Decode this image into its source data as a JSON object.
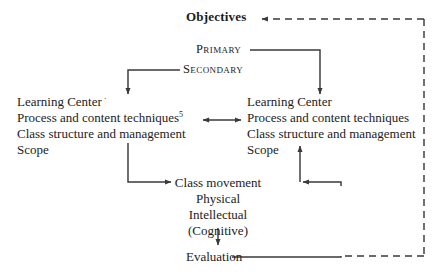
{
  "diagram": {
    "title_node": "Objectives",
    "level_nodes": {
      "primary": "Primary",
      "secondary": "Secondary"
    },
    "left_block": {
      "line1": "Learning Center",
      "line1_tick": "·",
      "line2": "Process and content techniques",
      "line2_superscript": "5",
      "line3": "Class structure and management",
      "line4": "Scope"
    },
    "right_block": {
      "line1": "Learning Center",
      "line2": "Process and content techniques",
      "line3": "Class structure and management",
      "line4": "Scope"
    },
    "center_stack": {
      "line1": "Class movement",
      "line2": "Physical",
      "line3": "Intellectual",
      "line4": "(Cognitive)"
    },
    "evaluation_node": "Evaluation",
    "colors": {
      "ink": "#1c1c1c",
      "line": "#3a3a3a",
      "background": "#ffffff"
    }
  }
}
